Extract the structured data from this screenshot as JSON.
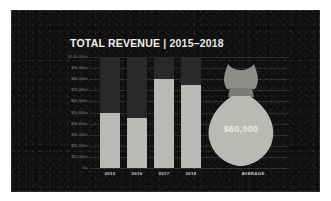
{
  "chart_data": {
    "type": "bar",
    "title": "TOTAL REVENUE | 2015–2018",
    "title_main": "TOTAL REVENUE",
    "title_separator": "|",
    "title_years": "2015–2018",
    "categories": [
      "2015",
      "2016",
      "2017",
      "2018"
    ],
    "values": [
      50000,
      45000,
      80000,
      75000
    ],
    "xlabel": "",
    "ylabel": "",
    "ylim": [
      0,
      100000
    ],
    "ytick_labels": [
      "$1,00,000",
      "$90,000",
      "$80,000",
      "$70,000",
      "$60,000",
      "$50,000",
      "$40,000",
      "$30,000",
      "$20,000",
      "$10,000",
      "0"
    ],
    "ytick_values": [
      100000,
      90000,
      80000,
      70000,
      60000,
      50000,
      40000,
      30000,
      20000,
      10000,
      0
    ],
    "grid": true,
    "legend": "none",
    "annotations": [
      {
        "name": "average",
        "label": "AVERAGE",
        "value": 60000,
        "value_label": "$60,000",
        "icon": "money-bag"
      }
    ],
    "colors": {
      "background": "#100f0f",
      "bar_fill": "#b9b9b5",
      "bar_track": "#2a2828",
      "grid": "#2e2e2c",
      "title_text": "#f2f2f0",
      "axis_text": "#8e8e8c",
      "category_text": "#cfcfcb",
      "bag_fill": "#b9b9b5",
      "bag_value_text": "#e9e9e6"
    }
  },
  "axis": {
    "x_categories": [
      "2015",
      "2016",
      "2017",
      "2018"
    ],
    "average_label": "AVERAGE"
  },
  "bag": {
    "value_label": "$60,000"
  }
}
